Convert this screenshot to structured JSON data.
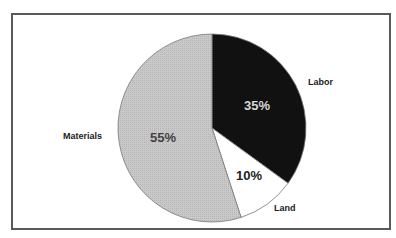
{
  "chart_data": {
    "type": "pie",
    "title": "",
    "categories": [
      "Labor",
      "Land",
      "Materials"
    ],
    "values": [
      35,
      10,
      55
    ],
    "unit": "%",
    "data_labels": [
      "35%",
      "10%",
      "55%"
    ],
    "colors": [
      "#111111",
      "#ffffff",
      "#c4c4c4"
    ],
    "start_angle_deg": 0,
    "direction": "clockwise",
    "legend": "none (direct labels)"
  },
  "labels": {
    "labor": "Labor",
    "land": "Land",
    "materials": "Materials",
    "labor_pct": "35%",
    "land_pct": "10%",
    "materials_pct": "55%"
  }
}
